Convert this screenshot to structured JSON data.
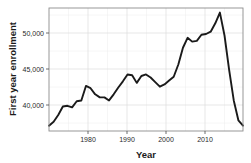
{
  "chart_data": {
    "type": "line",
    "title": "",
    "xlabel": "Year",
    "ylabel": "First year enrollment",
    "xlim": [
      1973,
      2015
    ],
    "ylim": [
      36500,
      52600
    ],
    "grid": true,
    "legend": null,
    "x_ticks": [
      1980,
      1990,
      2000,
      2010
    ],
    "x_tick_labels": [
      "1980",
      "1990",
      "2000",
      "2010"
    ],
    "y_ticks": [
      40000,
      45000,
      50000
    ],
    "y_tick_labels": [
      "40,000",
      "45,000",
      "50,000"
    ],
    "line_color": "#1a1a1a",
    "series": [
      {
        "name": "First year enrollment",
        "x": [
          1973,
          1974,
          1975,
          1976,
          1977,
          1978,
          1979,
          1980,
          1981,
          1982,
          1983,
          1984,
          1985,
          1986,
          1987,
          1988,
          1989,
          1990,
          1991,
          1992,
          1993,
          1994,
          1995,
          1996,
          1997,
          1998,
          1999,
          2000,
          2001,
          2002,
          2003,
          2004,
          2005,
          2006,
          2007,
          2008,
          2009,
          2010,
          2011,
          2012,
          2013,
          2014,
          2015
        ],
        "values": [
          37200,
          37700,
          38600,
          39700,
          39800,
          39600,
          40400,
          40500,
          42400,
          42100,
          41300,
          40900,
          40900,
          40500,
          41300,
          42200,
          43000,
          43900,
          43800,
          42800,
          43700,
          43900,
          43500,
          42900,
          42300,
          42600,
          43100,
          43600,
          45200,
          47400,
          48700,
          48200,
          48300,
          49100,
          49200,
          49500,
          50600,
          52000,
          49000,
          44500,
          40500,
          37900,
          37200
        ]
      }
    ]
  },
  "axes": {
    "y_axis_title": "First year enrollment",
    "x_axis_title": "Year"
  }
}
